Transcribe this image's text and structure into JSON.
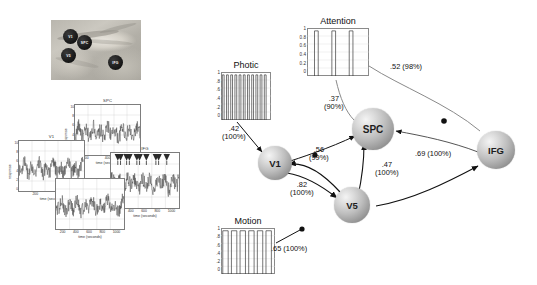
{
  "figure": {
    "type": "dcm-connectivity-diagram"
  },
  "brain_photo": {
    "name": "brain-slice",
    "regions": [
      {
        "label": "V1",
        "x": 20,
        "y": 17
      },
      {
        "label": "SPC",
        "x": 33,
        "y": 25
      },
      {
        "label": "V5",
        "x": 17,
        "y": 38
      },
      {
        "label": "IFG",
        "x": 66,
        "y": 47
      }
    ]
  },
  "timeseries": {
    "axis": {
      "xlabel": "time (seconds)",
      "ylabel": "response",
      "xticks": [
        "200",
        "400",
        "600",
        "800",
        "1000"
      ],
      "yticks": [
        "10",
        "8",
        "6",
        "4",
        "2",
        "0"
      ],
      "xlim": [
        0,
        1100
      ],
      "ylim": [
        0,
        10
      ]
    },
    "panels": [
      {
        "title": "SPC",
        "name": "timeseries-panel-spc"
      },
      {
        "title": "V1",
        "name": "timeseries-panel-v1"
      },
      {
        "title": "IFG",
        "name": "timeseries-panel-ifg"
      },
      {
        "title": "V5",
        "name": "timeseries-panel-v5"
      }
    ]
  },
  "inputs": [
    {
      "id": "photic",
      "label": "Photic",
      "yticks": [
        "1",
        ".8",
        ".6",
        ".4",
        ".2",
        "0"
      ],
      "ylim": [
        0,
        1
      ],
      "pulses": 11,
      "pulse_width_pct": 3.6,
      "pulse_gap_pct": 4.8
    },
    {
      "id": "attention",
      "label": "Attention",
      "yticks": [
        "1",
        "0.8",
        "0.6",
        "0.4",
        "0.2",
        "0"
      ],
      "ylim": [
        0,
        1
      ],
      "pulses": 4,
      "pulse_width_pct": 6,
      "pulse_gap_pct": 22
    },
    {
      "id": "motion",
      "label": "Motion",
      "yticks": [
        "1",
        ".8",
        ".6",
        ".4",
        ".2",
        "0"
      ],
      "ylim": [
        0,
        1
      ],
      "pulses": 6,
      "pulse_width_pct": 10,
      "pulse_gap_pct": 6
    }
  ],
  "nodes": [
    {
      "id": "v1",
      "label": "V1"
    },
    {
      "id": "v5",
      "label": "V5"
    },
    {
      "id": "spc",
      "label": "SPC"
    },
    {
      "id": "ifg",
      "label": "IFG"
    }
  ],
  "connections": [
    {
      "id": "photic-v1",
      "from": "Photic",
      "to": "V1",
      "strength": ".42",
      "confidence": "(100%)",
      "line1": ".42",
      "line2": "(100%)"
    },
    {
      "id": "motion-v5",
      "from": "Motion",
      "to": "V5",
      "strength": ".65",
      "confidence": "(100%)",
      "line1": ".65 (100%)",
      "line2": ""
    },
    {
      "id": "v1-v5",
      "from": "V1",
      "to": "V5",
      "strength": ".82",
      "confidence": "(100%)",
      "line1": ".82",
      "line2": "(100%)"
    },
    {
      "id": "v5-spc",
      "from": "V5",
      "to": "SPC",
      "strength": ".47",
      "confidence": "(100%)",
      "line1": ".47",
      "line2": "(100%)"
    },
    {
      "id": "v1-spc",
      "from": "V1",
      "to": "SPC",
      "strength": ".56",
      "confidence": "(99%)",
      "line1": ".56",
      "line2": "(99%)"
    },
    {
      "id": "attn-spc",
      "from": "Attention",
      "to": "SPC",
      "strength": ".37",
      "confidence": "(90%)",
      "line1": ".37",
      "line2": "(90%)"
    },
    {
      "id": "attn-ifg",
      "from": "Attention",
      "to": "IFG",
      "strength": ".52",
      "confidence": "(98%)",
      "line1": ".52 (98%)",
      "line2": ""
    },
    {
      "id": "v5-ifg",
      "from": "V5",
      "to": "IFG",
      "strength": ".69",
      "confidence": "(100%)",
      "line1": ".69 (100%)",
      "line2": ""
    }
  ],
  "colors": {
    "background": "#ffffff",
    "node_fill": "#b0b0b0",
    "edge_dark": "#1a1a1a",
    "edge_light": "#8a8a8a",
    "text": "#111111"
  }
}
